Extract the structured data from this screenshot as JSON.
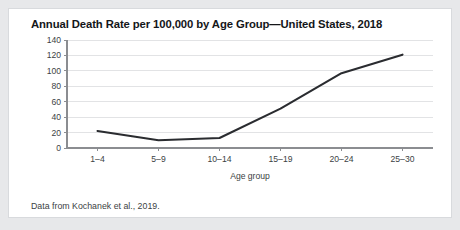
{
  "card": {
    "note": "Data from Kochanek et al., 2019."
  },
  "chart_data": {
    "type": "line",
    "title": "Annual Death Rate per 100,000 by Age Group—United States, 2018",
    "xlabel": "Age group",
    "ylabel": "",
    "categories": [
      "1–4",
      "5–9",
      "10–14",
      "15–19",
      "20–24",
      "25–30"
    ],
    "values": [
      22,
      10,
      13,
      51,
      97,
      121
    ],
    "series": [
      {
        "name": "Annual death rate per 100,000",
        "values": [
          22,
          10,
          13,
          51,
          97,
          121
        ],
        "color": "#2a2c30"
      }
    ],
    "ylim": [
      0,
      140
    ],
    "yticks": [
      0,
      20,
      40,
      60,
      80,
      100,
      120,
      140
    ],
    "ytick_labels": [
      "0",
      "20",
      "40",
      "60",
      "80",
      "100",
      "120",
      "140"
    ],
    "grid": true,
    "grid_axis": "y",
    "legend": false,
    "legend_position": "none"
  }
}
